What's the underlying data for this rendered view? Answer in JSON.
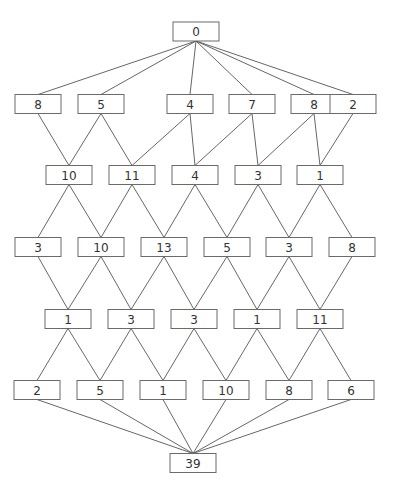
{
  "diagram": {
    "type": "layered-graph",
    "box": {
      "width": 46,
      "height": 19
    },
    "top": {
      "label": "0",
      "x": 196,
      "y": 31.5
    },
    "rows": [
      {
        "y": 104,
        "x": [
          38,
          101,
          190,
          252,
          314,
          353
        ],
        "labels": [
          "8",
          "5",
          "4",
          "7",
          "8",
          "2"
        ]
      },
      {
        "y": 175,
        "x": [
          69,
          132,
          195,
          258,
          320
        ],
        "labels": [
          "10",
          "11",
          "4",
          "3",
          "1"
        ]
      },
      {
        "y": 247,
        "x": [
          38,
          101,
          164,
          227,
          289,
          352
        ],
        "labels": [
          "3",
          "10",
          "13",
          "5",
          "3",
          "8"
        ]
      },
      {
        "y": 319,
        "x": [
          68,
          131,
          194,
          257,
          320
        ],
        "labels": [
          "1",
          "3",
          "3",
          "1",
          "11"
        ]
      },
      {
        "y": 390,
        "x": [
          37,
          100,
          163,
          226,
          289,
          351
        ],
        "labels": [
          "2",
          "5",
          "1",
          "10",
          "8",
          "6"
        ]
      }
    ],
    "bottom": {
      "label": "39",
      "x": 193,
      "y": 463
    },
    "colors": {
      "box_stroke": "#6a6a6a",
      "edge": "#555555",
      "text": "#333333",
      "background": "#ffffff"
    }
  }
}
